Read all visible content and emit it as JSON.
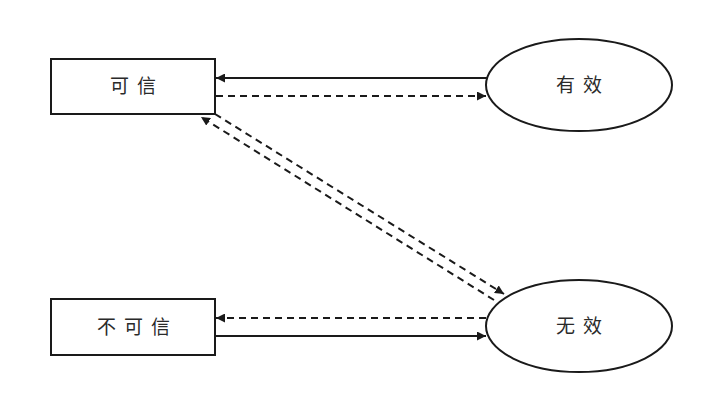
{
  "diagram": {
    "type": "state-transition",
    "colors": {
      "stroke": "#1a1a1a",
      "background": "#ffffff",
      "text": "#2a2a2a"
    },
    "nodes": [
      {
        "id": "credible",
        "shape": "rectangle",
        "label": "可信"
      },
      {
        "id": "valid",
        "shape": "ellipse",
        "label": "有效"
      },
      {
        "id": "not_credible",
        "shape": "rectangle",
        "label": "不可信"
      },
      {
        "id": "invalid",
        "shape": "ellipse",
        "label": "无效"
      }
    ],
    "edges": [
      {
        "from": "valid",
        "to": "credible",
        "style": "solid"
      },
      {
        "from": "credible",
        "to": "valid",
        "style": "dashed"
      },
      {
        "from": "invalid",
        "to": "credible",
        "style": "dashed"
      },
      {
        "from": "credible",
        "to": "invalid",
        "style": "dashed"
      },
      {
        "from": "invalid",
        "to": "not_credible",
        "style": "dashed"
      },
      {
        "from": "not_credible",
        "to": "invalid",
        "style": "solid"
      }
    ]
  }
}
